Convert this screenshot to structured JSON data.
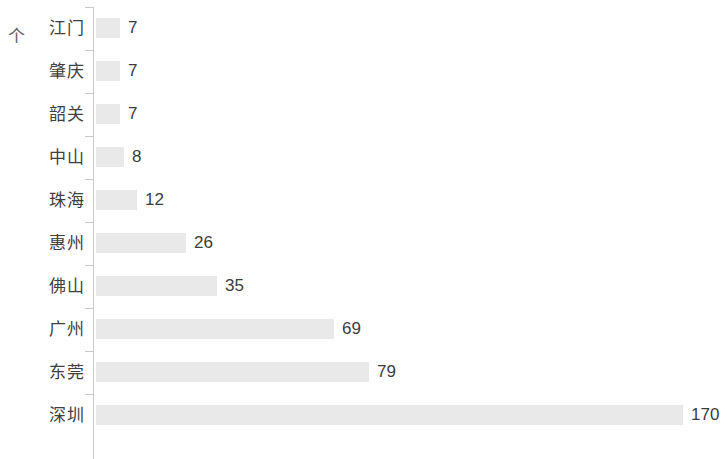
{
  "unit": {
    "label": "个"
  },
  "chart_data": {
    "type": "bar",
    "orientation": "horizontal",
    "title": "",
    "subtitle": "",
    "xlabel": "",
    "ylabel": "个",
    "grid": false,
    "legend": false,
    "legend_position": "none",
    "axis_line_color": "#c9c9c9",
    "bar_color": "#e9e9e9",
    "label_color": "#3c3c3c",
    "category_label_color": "#404040",
    "xlim": [
      0,
      180
    ],
    "categories": [
      "江门",
      "肇庆",
      "韶关",
      "中山",
      "珠海",
      "惠州",
      "佛山",
      "广州",
      "东莞",
      "深圳"
    ],
    "values": [
      7,
      7,
      7,
      8,
      12,
      26,
      35,
      69,
      79,
      170
    ],
    "value_labels": [
      "7",
      "7",
      "7",
      "8",
      "12",
      "26",
      "35",
      "69",
      "79",
      "170"
    ],
    "rows": [
      {
        "category": "江门",
        "value": 7,
        "value_label": "7"
      },
      {
        "category": "肇庆",
        "value": 7,
        "value_label": "7"
      },
      {
        "category": "韶关",
        "value": 7,
        "value_label": "7"
      },
      {
        "category": "中山",
        "value": 8,
        "value_label": "8"
      },
      {
        "category": "珠海",
        "value": 12,
        "value_label": "12"
      },
      {
        "category": "惠州",
        "value": 26,
        "value_label": "26"
      },
      {
        "category": "佛山",
        "value": 35,
        "value_label": "35"
      },
      {
        "category": "广州",
        "value": 69,
        "value_label": "69"
      },
      {
        "category": "东莞",
        "value": 79,
        "value_label": "79"
      },
      {
        "category": "深圳",
        "value": 170,
        "value_label": "170"
      }
    ]
  },
  "layout": {
    "bar_origin_x": 96,
    "px_per_unit": 3.45,
    "row_height": 43,
    "first_row_top": 7,
    "value_label_gap": 8
  }
}
